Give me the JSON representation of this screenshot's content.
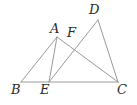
{
  "figure": {
    "kind": "geometry-diagram",
    "width": 137,
    "height": 105,
    "background_color": "#ffffff",
    "stroke_color": "#9a9a9a",
    "stroke_width": 1,
    "label_color": "#2b2b2b",
    "points": {
      "A": {
        "label": "A",
        "x": 57,
        "y": 37
      },
      "B": {
        "label": "B",
        "x": 21,
        "y": 82
      },
      "C": {
        "label": "C",
        "x": 118,
        "y": 82
      },
      "D": {
        "label": "D",
        "x": 98,
        "y": 20
      },
      "E": {
        "label": "E",
        "x": 49,
        "y": 82
      },
      "F": {
        "label": "F",
        "x": 72,
        "y": 42
      }
    },
    "segments": [
      {
        "name": "segment-BC",
        "from": "B",
        "to": "C"
      },
      {
        "name": "segment-BA",
        "from": "B",
        "to": "A"
      },
      {
        "name": "segment-AE",
        "from": "A",
        "to": "E"
      },
      {
        "name": "segment-AC",
        "from": "A",
        "to": "C"
      },
      {
        "name": "segment-ED",
        "from": "E",
        "to": "D"
      },
      {
        "name": "segment-DC",
        "from": "D",
        "to": "C"
      }
    ],
    "labels_order": [
      "D",
      "A",
      "F",
      "B",
      "E",
      "C"
    ]
  }
}
